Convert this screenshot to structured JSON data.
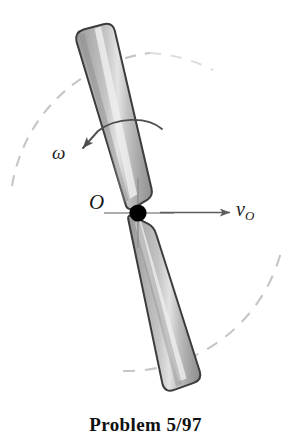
{
  "figure": {
    "caption": "Problem 5/97",
    "labels": {
      "pivot": "O",
      "angular_velocity": "ω",
      "velocity_symbol": "v",
      "velocity_subscript": "O"
    },
    "colors": {
      "background": "#ffffff",
      "bar_outline": "#3f3f3f",
      "bar_fill": "#a9a9a9",
      "bar_highlight": "#dcdcdc",
      "bar_shadow": "#8e8e8e",
      "dashed_circle": "#c9c9c9",
      "arrow": "#5a5a5a",
      "pivot_dot": "#000000",
      "crosshair": "#8a8a8a",
      "text": "#1a1a1a"
    },
    "elements": {
      "bar": "slender-bar-rotating-about-point-O",
      "dashed_circle": "circular-path-traced-by-bar-ends",
      "omega_arrow": "curved-arrow-indicating-angular-velocity",
      "velocity_arrow": "straight-arrow-indicating-velocity-of-O",
      "pivot_marker": "filled-dot-at-point-O",
      "crosshair": "center-crosshair-at-point-O"
    },
    "geometry": {
      "pivot_x": 138,
      "pivot_y": 213,
      "circle_radius": 160,
      "bar_top_x": 93,
      "bar_top_y": 34,
      "bar_bottom_x": 196,
      "bar_bottom_y": 392
    }
  }
}
